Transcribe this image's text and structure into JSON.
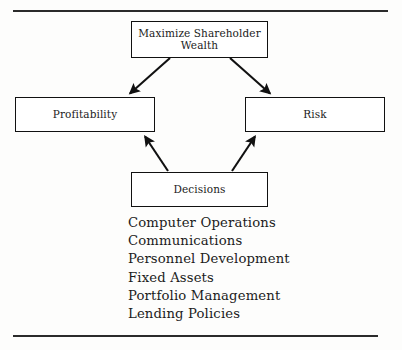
{
  "page": {
    "background_color": "#fdfdfc",
    "ink_color": "#1b1b1b"
  },
  "rules": {
    "top_label": "top-horizontal-rule",
    "bottom_label": "bottom-horizontal-rule"
  },
  "diagram": {
    "type": "flow-diagram",
    "nodes": [
      {
        "id": "goal",
        "label": "Maximize Shareholder\nWealth"
      },
      {
        "id": "profitability",
        "label": "Profitability"
      },
      {
        "id": "risk",
        "label": "Risk"
      },
      {
        "id": "decisions",
        "label": "Decisions"
      }
    ],
    "edges": [
      {
        "from": "goal",
        "to": "profitability",
        "direction": "down-left"
      },
      {
        "from": "goal",
        "to": "risk",
        "direction": "down-right"
      },
      {
        "from": "decisions",
        "to": "profitability",
        "direction": "up-left"
      },
      {
        "from": "decisions",
        "to": "risk",
        "direction": "up-right"
      }
    ]
  },
  "list": {
    "items": [
      "Computer Operations",
      "Communications",
      "Personnel Development",
      "Fixed Assets",
      "Portfolio Management",
      "Lending Policies"
    ]
  }
}
